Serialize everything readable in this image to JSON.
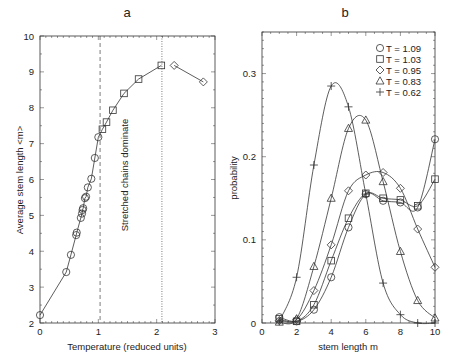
{
  "figure": {
    "panel_a_title": "a",
    "panel_b_title": "b"
  },
  "chart_data": [
    {
      "type": "line",
      "panel": "a",
      "title": "a",
      "xlabel": "Temperature (reduced units)",
      "ylabel": "Average stem length <m>",
      "xlim": [
        0,
        3
      ],
      "ylim": [
        2,
        10
      ],
      "xticks": [
        0,
        1,
        2,
        3
      ],
      "yticks": [
        2,
        3,
        4,
        5,
        6,
        7,
        8,
        9,
        10
      ],
      "grid": false,
      "annotation": "Stretched chains dominate",
      "vlines": [
        {
          "x": 1.03,
          "style": "dashed"
        },
        {
          "x": 2.09,
          "style": "dotted"
        }
      ],
      "series": [
        {
          "name": "circles",
          "marker": "circle",
          "connected_to_next": true,
          "x": [
            0.0,
            0.45,
            0.53,
            0.62,
            0.63,
            0.7,
            0.72,
            0.73,
            0.74,
            0.77,
            0.79,
            0.82,
            0.88,
            0.94,
            1.0
          ],
          "y": [
            2.22,
            3.42,
            3.9,
            4.45,
            4.52,
            4.93,
            5.05,
            5.15,
            5.2,
            5.48,
            5.52,
            5.78,
            6.02,
            6.6,
            7.18
          ]
        },
        {
          "name": "squares",
          "marker": "square",
          "x": [
            1.07,
            1.14,
            1.25,
            1.44,
            1.69,
            2.08
          ],
          "y": [
            7.4,
            7.6,
            7.93,
            8.4,
            8.8,
            9.18
          ]
        },
        {
          "name": "diamonds",
          "marker": "diamond",
          "x": [
            2.3,
            2.8
          ],
          "y": [
            9.18,
            8.72
          ]
        }
      ]
    },
    {
      "type": "line",
      "panel": "b",
      "title": "b",
      "xlabel": "stem length m",
      "ylabel": "probability",
      "xlim": [
        0,
        10
      ],
      "ylim": [
        0,
        0.35
      ],
      "xticks": [
        0,
        2,
        4,
        6,
        8,
        10
      ],
      "yticks": [
        0,
        0.1,
        0.2,
        0.3
      ],
      "ytick_labels": [
        "0",
        "0.1",
        "0.2",
        "0.3"
      ],
      "grid": false,
      "legend_position": "upper right",
      "x": [
        1,
        2,
        3,
        4,
        5,
        6,
        7,
        8,
        9,
        10
      ],
      "series": [
        {
          "name": "T = 1.09",
          "marker": "circle",
          "values": [
            0.007,
            0.002,
            0.016,
            0.055,
            0.115,
            0.155,
            0.147,
            0.145,
            0.139,
            0.221
          ]
        },
        {
          "name": "T = 1.03",
          "marker": "square",
          "values": [
            0.005,
            0.002,
            0.022,
            0.075,
            0.126,
            0.156,
            0.15,
            0.148,
            0.141,
            0.173
          ]
        },
        {
          "name": "T = 0.95",
          "marker": "diamond",
          "values": [
            0.003,
            0.004,
            0.039,
            0.094,
            0.159,
            0.178,
            0.181,
            0.162,
            0.113,
            0.067
          ]
        },
        {
          "name": "T = 0.83",
          "marker": "triangle",
          "values": [
            0.001,
            0.005,
            0.068,
            0.15,
            0.234,
            0.244,
            0.17,
            0.086,
            0.027,
            0.006
          ]
        },
        {
          "name": "T = 0.62",
          "marker": "plus",
          "values": [
            0.002,
            0.055,
            0.19,
            0.285,
            0.26,
            0.155,
            0.048,
            0.01,
            0.0,
            0.0
          ]
        }
      ]
    }
  ]
}
